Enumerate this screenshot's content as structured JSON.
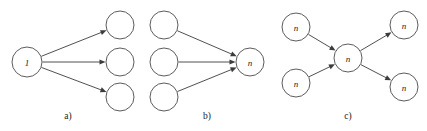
{
  "figure": {
    "title": "",
    "background_color": "#ffffff",
    "stroke_color": "#4a4a4a",
    "edge_color": "#3c3c3c",
    "label_color": "#1a1a1a",
    "width": 427,
    "height": 131
  },
  "panels": [
    {
      "id": "a",
      "caption": "a)",
      "caption_x": 68,
      "caption_y": 116,
      "description": "one-to-many fan-out",
      "nodes": [
        {
          "id": "a-src",
          "label": "1",
          "cx": 27,
          "cy": 62,
          "r": 15
        },
        {
          "id": "a-dst1",
          "label": "",
          "cx": 120,
          "cy": 25,
          "r": 14
        },
        {
          "id": "a-dst2",
          "label": "",
          "cx": 120,
          "cy": 62,
          "r": 14
        },
        {
          "id": "a-dst3",
          "label": "",
          "cx": 120,
          "cy": 97,
          "r": 14
        }
      ],
      "edges": [
        {
          "from": "a-src",
          "to": "a-dst1"
        },
        {
          "from": "a-src",
          "to": "a-dst2"
        },
        {
          "from": "a-src",
          "to": "a-dst3"
        }
      ]
    },
    {
      "id": "b",
      "caption": "b)",
      "caption_x": 207,
      "caption_y": 116,
      "description": "many-to-one fan-in",
      "nodes": [
        {
          "id": "b-src1",
          "label": "",
          "cx": 164,
          "cy": 25,
          "r": 14
        },
        {
          "id": "b-src2",
          "label": "",
          "cx": 164,
          "cy": 62,
          "r": 14
        },
        {
          "id": "b-src3",
          "label": "",
          "cx": 164,
          "cy": 97,
          "r": 14
        },
        {
          "id": "b-dst",
          "label": "n",
          "cx": 250,
          "cy": 62,
          "r": 14
        }
      ],
      "edges": [
        {
          "from": "b-src1",
          "to": "b-dst"
        },
        {
          "from": "b-src2",
          "to": "b-dst"
        },
        {
          "from": "b-src3",
          "to": "b-dst"
        }
      ]
    },
    {
      "id": "c",
      "caption": "c)",
      "caption_x": 348,
      "caption_y": 116,
      "description": "many-to-many through hub",
      "nodes": [
        {
          "id": "c-src1",
          "label": "n",
          "cx": 296,
          "cy": 27,
          "r": 14
        },
        {
          "id": "c-src2",
          "label": "n",
          "cx": 296,
          "cy": 83,
          "r": 14
        },
        {
          "id": "c-mid",
          "label": "n",
          "cx": 348,
          "cy": 58,
          "r": 14
        },
        {
          "id": "c-dst1",
          "label": "n",
          "cx": 404,
          "cy": 25,
          "r": 14
        },
        {
          "id": "c-dst2",
          "label": "n",
          "cx": 404,
          "cy": 87,
          "r": 14
        }
      ],
      "edges": [
        {
          "from": "c-src1",
          "to": "c-mid"
        },
        {
          "from": "c-src2",
          "to": "c-mid"
        },
        {
          "from": "c-mid",
          "to": "c-dst1"
        },
        {
          "from": "c-mid",
          "to": "c-dst2"
        }
      ]
    }
  ]
}
